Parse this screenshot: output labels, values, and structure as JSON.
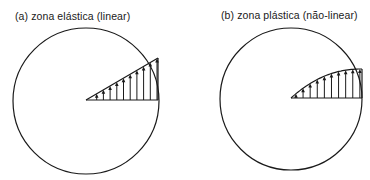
{
  "panels": [
    {
      "id": "a",
      "caption": "(a)  zona elástica (linear)",
      "distribution": "linear",
      "arrow_count": 10
    },
    {
      "id": "b",
      "caption": "(b) zona plástica (não-linear)",
      "distribution": "nonlinear",
      "arrow_count": 10
    }
  ],
  "colors": {
    "ink": "#1a1a1a",
    "background": "#ffffff"
  }
}
